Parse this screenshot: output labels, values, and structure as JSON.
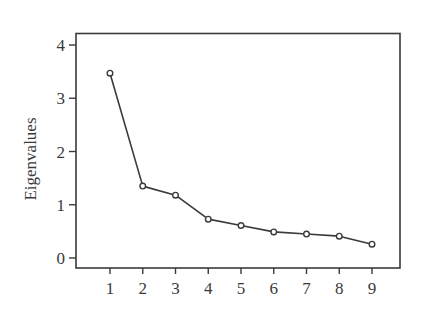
{
  "chart_data": {
    "type": "line",
    "title": "",
    "xlabel": "",
    "ylabel": "Eigenvalues",
    "x": [
      1,
      2,
      3,
      4,
      5,
      6,
      7,
      8,
      9
    ],
    "categories": [
      "1",
      "2",
      "3",
      "4",
      "5",
      "6",
      "7",
      "8",
      "9"
    ],
    "series": [
      {
        "name": "Eigenvalues",
        "values": [
          3.47,
          1.35,
          1.18,
          0.73,
          0.61,
          0.49,
          0.45,
          0.41,
          0.26
        ],
        "marker": "open-circle",
        "color": "#3a3a3a"
      }
    ],
    "xlim": [
      0.0,
      9.9
    ],
    "ylim": [
      -0.2,
      4.2
    ],
    "xticks": [
      1,
      2,
      3,
      4,
      5,
      6,
      7,
      8,
      9
    ],
    "yticks": [
      0,
      1,
      2,
      3,
      4
    ],
    "ytick_labels": [
      "0",
      "1",
      "2",
      "3",
      "4"
    ],
    "grid": false,
    "legend": null
  },
  "style": {
    "line_color": "#3a3a3a",
    "axis_color": "#3a3a3a",
    "background": "#ffffff"
  }
}
